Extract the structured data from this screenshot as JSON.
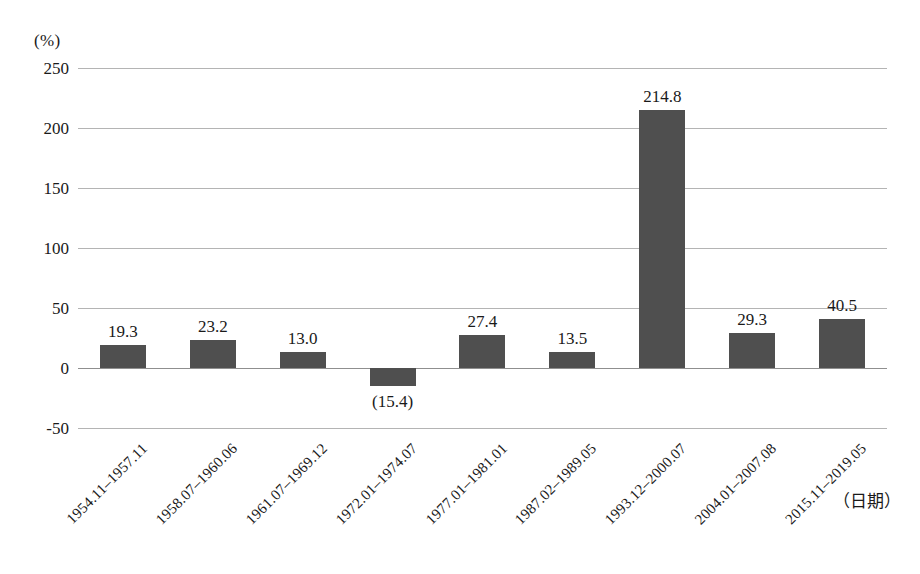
{
  "chart_data": {
    "type": "bar",
    "title": "",
    "subtitle": "",
    "xlabel": "（日期）",
    "ylabel": "(%)",
    "categories": [
      "1954.11–1957.11",
      "1958.07–1960.06",
      "1961.07–1969.12",
      "1972.01–1974.07",
      "1977.01–1981.01",
      "1987.02–1989.05",
      "1993.12–2000.07",
      "2004.01–2007.08",
      "2015.11–2019.05"
    ],
    "values": [
      19.3,
      23.2,
      13.0,
      -15.4,
      27.4,
      13.5,
      214.8,
      29.3,
      40.5
    ],
    "value_labels": [
      "19.3",
      "23.2",
      "13.0",
      "(15.4)",
      "27.4",
      "13.5",
      "214.8",
      "29.3",
      "40.5"
    ],
    "ylim": [
      -50,
      250
    ],
    "yticks": [
      250,
      200,
      150,
      100,
      50,
      0,
      -50
    ],
    "ytick_labels": [
      "250",
      "200",
      "150",
      "100",
      "50",
      "0",
      "-50"
    ],
    "grid": true,
    "legend": "none",
    "legend_position": "none",
    "bar_color": "#4f4f4f",
    "gridline_color": "#b4b4b4",
    "zero_line_color": "#8f8f8f",
    "text_color": "#1a1a1a",
    "negative_label_notation": "parentheses"
  }
}
